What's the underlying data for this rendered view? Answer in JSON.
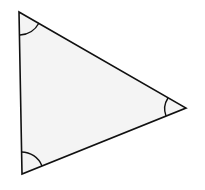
{
  "diagram": {
    "shape": "triangle",
    "fill": "#f4f4f4",
    "stroke": "#111111",
    "vertices": {
      "top_left": [
        19,
        12
      ],
      "bottom_left": [
        22,
        174
      ],
      "right": [
        186,
        108
      ]
    },
    "angle_marks": [
      "top-left",
      "bottom-left",
      "right"
    ]
  }
}
